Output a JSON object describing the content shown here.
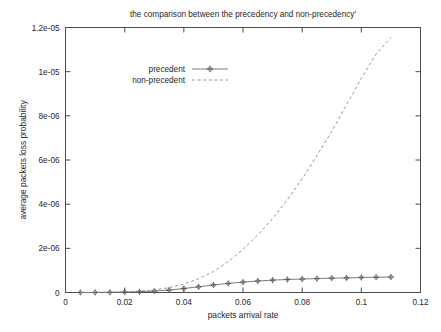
{
  "chart_data": {
    "type": "line",
    "title": "the comparison between the precedency and non-precedency'",
    "xlabel": "packets arrival rate",
    "ylabel": "average packets loss probability",
    "xlim": [
      0,
      0.12
    ],
    "ylim": [
      0,
      1.2e-05
    ],
    "grid": false,
    "legend_position": "upper-left-inside",
    "xticks": [
      0,
      0.02,
      0.04,
      0.06,
      0.08,
      0.1,
      0.12
    ],
    "xtick_labels": [
      "0",
      "0.02",
      "0.04",
      "0.06",
      "0.08",
      "0.1",
      "0.12"
    ],
    "yticks": [
      0,
      2e-06,
      4e-06,
      6e-06,
      8e-06,
      1e-05,
      1.2e-05
    ],
    "ytick_labels": [
      "0",
      "2e-06",
      "4e-06",
      "6e-06",
      "8e-06",
      "1e-05",
      "1.2e-05"
    ],
    "series": [
      {
        "name": "precedent",
        "style": "solid-with-points",
        "marker": "diamond-plus",
        "color": "#6e6e6e",
        "x": [
          0.005,
          0.01,
          0.015,
          0.02,
          0.025,
          0.03,
          0.035,
          0.04,
          0.045,
          0.05,
          0.055,
          0.06,
          0.065,
          0.07,
          0.075,
          0.08,
          0.085,
          0.09,
          0.095,
          0.1,
          0.105,
          0.11
        ],
        "values": [
          1e-09,
          3e-09,
          8e-09,
          1.8e-08,
          3.5e-08,
          6.5e-08,
          1.1e-07,
          1.8e-07,
          2.6e-07,
          3.4e-07,
          4.1e-07,
          4.7e-07,
          5.2e-07,
          5.6e-07,
          5.9e-07,
          6.1e-07,
          6.3e-07,
          6.5e-07,
          6.6e-07,
          6.8e-07,
          6.9e-07,
          7e-07
        ]
      },
      {
        "name": "non-precedent",
        "style": "dashed",
        "marker": "none",
        "color": "#8a8a8a",
        "x": [
          0.005,
          0.01,
          0.015,
          0.02,
          0.025,
          0.03,
          0.035,
          0.04,
          0.045,
          0.05,
          0.055,
          0.06,
          0.065,
          0.07,
          0.075,
          0.08,
          0.085,
          0.09,
          0.095,
          0.1,
          0.105,
          0.11
        ],
        "values": [
          1e-09,
          4e-09,
          1.2e-08,
          3e-08,
          6e-08,
          1.2e-07,
          2.2e-07,
          3.8e-07,
          6.2e-07,
          9.5e-07,
          1.4e-06,
          1.95e-06,
          2.6e-06,
          3.35e-06,
          4.2e-06,
          5.15e-06,
          6.2e-06,
          7.3e-06,
          8.5e-06,
          9.7e-06,
          1.08e-05,
          1.155e-05
        ]
      }
    ]
  },
  "legend": {
    "entries": [
      {
        "label": "precedent"
      },
      {
        "label": "non-precedent"
      }
    ]
  }
}
